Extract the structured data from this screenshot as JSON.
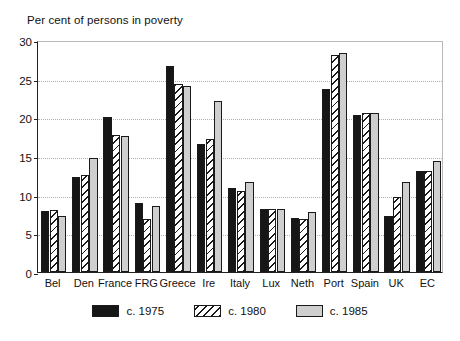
{
  "chart_data": {
    "type": "bar",
    "title": "Per cent of persons in poverty",
    "xlabel": "",
    "ylabel": "",
    "ylim": [
      0,
      30
    ],
    "yticks": [
      0,
      5,
      10,
      15,
      20,
      25,
      30
    ],
    "grid": true,
    "legend_position": "bottom",
    "categories": [
      "Bel",
      "Den",
      "France",
      "FRG",
      "Greece",
      "Ire",
      "Italy",
      "Lux",
      "Neth",
      "Port",
      "Spain",
      "UK",
      "EC"
    ],
    "series": [
      {
        "name": "c. 1975",
        "color": "#161616",
        "pattern": "solid-black",
        "values": [
          7.9,
          12.3,
          20.0,
          8.9,
          26.7,
          16.6,
          10.8,
          8.2,
          7.0,
          23.7,
          20.3,
          7.2,
          13.0
        ]
      },
      {
        "name": "c. 1980",
        "color": "#ffffff",
        "pattern": "diagonal-hatch",
        "values": [
          8.0,
          12.5,
          17.7,
          6.9,
          24.3,
          17.2,
          10.5,
          8.2,
          6.9,
          28.0,
          20.6,
          9.7,
          13.0
        ]
      },
      {
        "name": "c. 1985",
        "color": "#cfcfcf",
        "pattern": "solid-grey",
        "values": [
          7.2,
          14.7,
          17.6,
          8.5,
          24.1,
          22.1,
          11.7,
          8.2,
          7.8,
          28.3,
          20.5,
          11.7,
          14.3
        ]
      }
    ]
  }
}
